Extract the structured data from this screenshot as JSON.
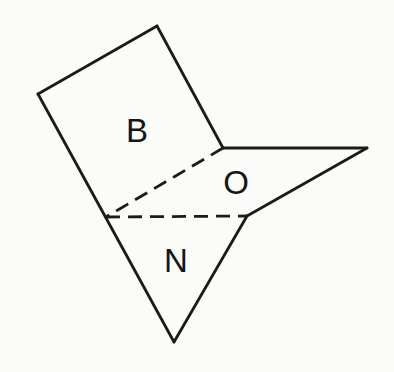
{
  "figure": {
    "width": 394,
    "height": 372,
    "background": "#fbfbf9",
    "stroke_color": "#1b1b19",
    "stroke_width": 2.8,
    "dash_pattern": "14 8",
    "solid_edges": [
      {
        "name": "plane-b-top-edge",
        "from": [
          157,
          26
        ],
        "to": [
          38,
          94
        ]
      },
      {
        "name": "planes-left-edge",
        "from": [
          38,
          94
        ],
        "to": [
          174,
          342
        ]
      },
      {
        "name": "plane-n-right-edge",
        "from": [
          174,
          342
        ],
        "to": [
          247,
          216
        ]
      },
      {
        "name": "plane-o-front-edge",
        "from": [
          247,
          216
        ],
        "to": [
          367,
          148
        ]
      },
      {
        "name": "plane-o-top-edge",
        "from": [
          367,
          148
        ],
        "to": [
          223,
          148
        ]
      },
      {
        "name": "plane-b-right-edge",
        "from": [
          223,
          148
        ],
        "to": [
          157,
          26
        ]
      }
    ],
    "dashed_edges": [
      {
        "name": "hidden-edge-upper",
        "from": [
          223,
          148
        ],
        "to": [
          106,
          217
        ]
      },
      {
        "name": "hidden-edge-lower",
        "from": [
          106,
          217
        ],
        "to": [
          247,
          216
        ]
      }
    ],
    "labels": [
      {
        "id": "b",
        "text": "B",
        "x": 137,
        "y": 130
      },
      {
        "id": "o",
        "text": "O",
        "x": 236,
        "y": 182
      },
      {
        "id": "n",
        "text": "N",
        "x": 176,
        "y": 260
      }
    ]
  }
}
